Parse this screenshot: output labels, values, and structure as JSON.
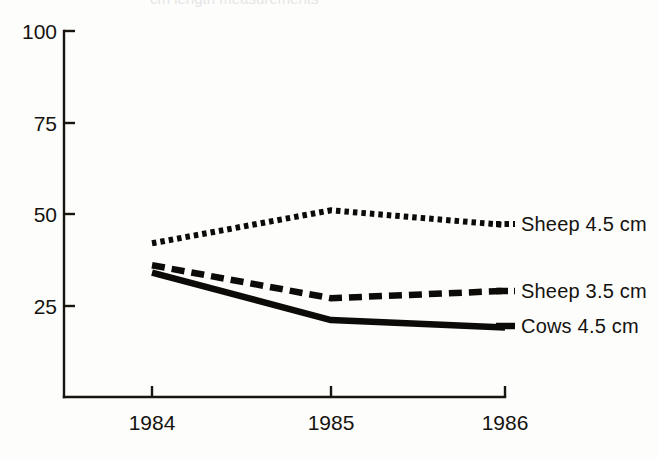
{
  "figure": {
    "background_color": "#fdfdfc",
    "ink_color": "#0c0b08",
    "cropped_caption_fragment": "cm length measurements"
  },
  "axes": {
    "y": {
      "ticks": [
        "100",
        "75",
        "50",
        "25"
      ],
      "tick_values": [
        100,
        75,
        50,
        25
      ],
      "range": [
        0,
        100
      ],
      "label": ""
    },
    "x": {
      "ticks": [
        "1984",
        "1985",
        "1986"
      ],
      "label": ""
    }
  },
  "legend": {
    "position": "right",
    "entries": [
      {
        "label": "Sheep 4.5 cm",
        "style": "dotted",
        "marker_name": "legend-marker-dotted"
      },
      {
        "label": "Sheep 3.5 cm",
        "style": "dashed",
        "marker_name": "legend-marker-dashed"
      },
      {
        "label": "Cows  4.5 cm",
        "style": "solid",
        "marker_name": "legend-marker-solid"
      }
    ]
  },
  "chart_data": {
    "type": "line",
    "title": "",
    "xlabel": "",
    "ylabel": "",
    "x": [
      "1984",
      "1985",
      "1986"
    ],
    "categories": [
      "1984",
      "1985",
      "1986"
    ],
    "ylim": [
      0,
      100
    ],
    "yticks": [
      25,
      50,
      75,
      100
    ],
    "grid": false,
    "legend_position": "right",
    "series": [
      {
        "name": "Sheep 4.5 cm",
        "style": "dotted",
        "values": [
          42,
          51,
          47
        ]
      },
      {
        "name": "Sheep 3.5 cm",
        "style": "dashed",
        "values": [
          36,
          27,
          29
        ]
      },
      {
        "name": "Cows 4.5 cm",
        "style": "solid",
        "values": [
          34,
          21,
          19
        ]
      }
    ]
  }
}
